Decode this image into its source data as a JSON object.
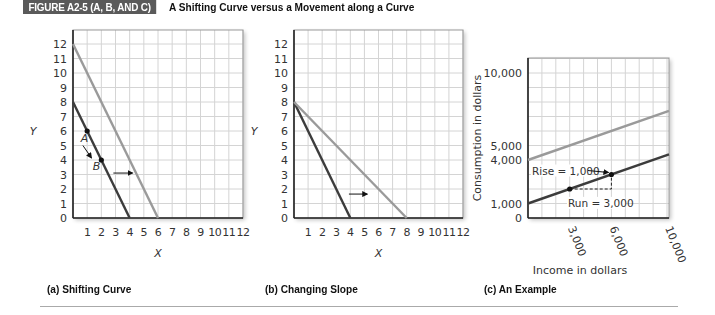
{
  "figure": {
    "tag": "FIGURE A2-5 (A, B, AND C)",
    "title": "A Shifting Curve versus a Movement along a Curve"
  },
  "captions": {
    "a": "(a) Shifting Curve",
    "b": "(b) Changing Slope",
    "c": "(c) An Example"
  },
  "colors": {
    "dark_line": "#3c3c3c",
    "light_line": "#9a9a9a",
    "grid": "#d4d4d4",
    "axis": "#222222",
    "tag_bg": "#5a5a5a"
  },
  "chart_data": [
    {
      "type": "line",
      "title": "(a) Shifting Curve",
      "xlabel": "X",
      "ylabel": "Y",
      "xlim": [
        0,
        12
      ],
      "ylim": [
        0,
        12
      ],
      "x_ticks": [
        1,
        2,
        3,
        4,
        5,
        6,
        7,
        8,
        9,
        10,
        11,
        12
      ],
      "y_ticks": [
        0,
        1,
        2,
        3,
        4,
        5,
        6,
        7,
        8,
        9,
        10,
        11,
        12
      ],
      "grid": true,
      "series": [
        {
          "name": "original curve",
          "color": "dark",
          "points": [
            [
              0,
              8
            ],
            [
              4,
              0
            ]
          ]
        },
        {
          "name": "shifted curve",
          "color": "light",
          "points": [
            [
              0,
              12
            ],
            [
              6,
              0
            ]
          ]
        }
      ],
      "points": [
        {
          "label": "A",
          "x": 1,
          "y": 6
        },
        {
          "label": "B",
          "x": 2,
          "y": 4
        }
      ],
      "annotations": [
        {
          "type": "arrow",
          "from": [
            0.6,
            5.4
          ],
          "to": [
            1.3,
            4.3
          ],
          "note": "movement along curve A to B"
        },
        {
          "type": "arrow",
          "from": [
            3,
            3
          ],
          "to": [
            4.5,
            3
          ],
          "note": "shift right"
        }
      ]
    },
    {
      "type": "line",
      "title": "(b) Changing Slope",
      "xlabel": "X",
      "ylabel": "Y",
      "xlim": [
        0,
        12
      ],
      "ylim": [
        0,
        12
      ],
      "x_ticks": [
        1,
        2,
        3,
        4,
        5,
        6,
        7,
        8,
        9,
        10,
        11,
        12
      ],
      "y_ticks": [
        0,
        1,
        2,
        3,
        4,
        5,
        6,
        7,
        8,
        9,
        10,
        11,
        12
      ],
      "grid": true,
      "series": [
        {
          "name": "steep curve",
          "color": "dark",
          "points": [
            [
              0,
              8
            ],
            [
              4,
              0
            ]
          ]
        },
        {
          "name": "flatter curve",
          "color": "light",
          "points": [
            [
              0,
              8
            ],
            [
              8,
              0
            ]
          ]
        }
      ],
      "annotations": [
        {
          "type": "arrow",
          "from": [
            4,
            1.6
          ],
          "to": [
            5.4,
            1.6
          ],
          "note": "slope change"
        }
      ]
    },
    {
      "type": "line",
      "title": "(c) An Example",
      "xlabel": "Income in dollars",
      "ylabel": "Consumption in dollars",
      "xlim": [
        0,
        10000
      ],
      "ylim": [
        0,
        10000
      ],
      "x_ticks": [
        "3,000",
        "6,000",
        "10,000"
      ],
      "y_ticks": [
        "0",
        "1,000",
        "4,000",
        "5,000",
        "10,000"
      ],
      "grid": true,
      "series": [
        {
          "name": "consumption function",
          "color": "dark",
          "points": [
            [
              0,
              1000
            ],
            [
              10000,
              4333
            ]
          ]
        },
        {
          "name": "shifted consumption function",
          "color": "light",
          "points": [
            [
              0,
              4000
            ],
            [
              10000,
              7333
            ]
          ]
        }
      ],
      "points": [
        {
          "x": 3000,
          "y": 2000
        },
        {
          "x": 6000,
          "y": 3000
        }
      ],
      "annotations": [
        {
          "type": "label",
          "text": "Rise = 1,000"
        },
        {
          "type": "label",
          "text": "Run = 3,000"
        }
      ]
    }
  ],
  "labels": {
    "a_x": "X",
    "a_y": "Y",
    "b_x": "X",
    "b_y": "Y",
    "c_x": "Income in dollars",
    "c_y": "Consumption in dollars",
    "pointA": "A",
    "pointB": "B",
    "rise": "Rise = 1,000",
    "run": "Run = 3,000",
    "c_yt0": "0",
    "c_yt1": "1,000",
    "c_yt4": "4,000",
    "c_yt5": "5,000",
    "c_yt10": "10,000",
    "c_xt3": "3,000",
    "c_xt6": "6,000",
    "c_xt10": "10,000"
  }
}
